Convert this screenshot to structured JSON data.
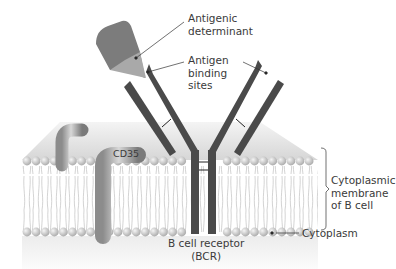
{
  "labels": {
    "antigenic_determinant": "Antigenic\ndeterminant",
    "antigen_binding_sites": "Antigen\nbinding\nsites",
    "cd35": "CD35",
    "membrane": "Cytoplasmic\nmembrane\nof B cell",
    "bcr": "B cell receptor\n(BCR)",
    "cytoplasm": "Cytoplasm"
  },
  "colors": {
    "background": "#ffffff",
    "receptor": "#4a4a4a",
    "antigen_body": "#7a7a7a",
    "antigen_tip": "#a8a8a8",
    "membrane_head": "#cfcfcf",
    "membrane_top": "#dcdcdc",
    "cd_protein": "#9a9a9a",
    "text": "#3a3a3a",
    "leader": "#333333"
  }
}
